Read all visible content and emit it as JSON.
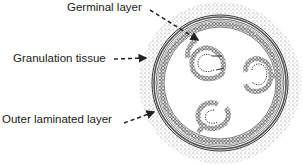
{
  "diagram": {
    "type": "cross-section illustration",
    "labels": [
      {
        "id": "germinal",
        "text": "Germinal layer"
      },
      {
        "id": "granulation",
        "text": "Granulation tissue"
      },
      {
        "id": "laminated",
        "text": "Outer laminated layer"
      }
    ],
    "brood_capsules": 3,
    "colors": {
      "ink": "#222222",
      "stipple": "#8a8a8a",
      "background": "#ffffff"
    }
  }
}
